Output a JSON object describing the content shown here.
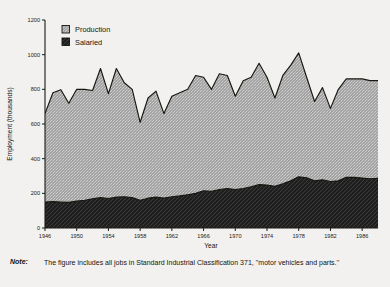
{
  "chart_data": {
    "type": "area",
    "title": "",
    "xlabel": "Year",
    "ylabel": "Employment (thousands)",
    "xlim": [
      1946,
      1988
    ],
    "ylim": [
      0,
      1200
    ],
    "ytick_values": [
      0,
      200,
      400,
      600,
      800,
      1000,
      1200
    ],
    "ytick_labels": [
      "0",
      "200",
      "400",
      "600",
      "800",
      "1000",
      "1200"
    ],
    "xtick_values": [
      1946,
      1950,
      1954,
      1958,
      1962,
      1966,
      1970,
      1974,
      1978,
      1982,
      1986
    ],
    "xtick_labels": [
      "1946",
      "1950",
      "1954",
      "1958",
      "1962",
      "1966",
      "1970",
      "1974",
      "1978",
      "1982",
      "1986"
    ],
    "grid": false,
    "stacked": true,
    "legend_position": "upper-left",
    "x": [
      1946,
      1947,
      1948,
      1949,
      1950,
      1951,
      1952,
      1953,
      1954,
      1955,
      1956,
      1957,
      1958,
      1959,
      1960,
      1961,
      1962,
      1963,
      1964,
      1965,
      1966,
      1967,
      1968,
      1969,
      1970,
      1971,
      1972,
      1973,
      1974,
      1975,
      1976,
      1977,
      1978,
      1979,
      1980,
      1981,
      1982,
      1983,
      1984,
      1985,
      1986,
      1987,
      1988
    ],
    "series": [
      {
        "name": "Salaried",
        "color": "#232323",
        "pattern": "diagonal-hatch-dark",
        "values": [
          150,
          152,
          150,
          148,
          155,
          160,
          168,
          175,
          170,
          178,
          180,
          176,
          160,
          172,
          178,
          172,
          180,
          185,
          192,
          200,
          215,
          212,
          222,
          228,
          222,
          228,
          238,
          250,
          248,
          240,
          255,
          272,
          295,
          290,
          272,
          278,
          268,
          272,
          292,
          292,
          288,
          284,
          286
        ]
      },
      {
        "name": "Production",
        "color": "#9d9d9d",
        "pattern": "stipple-light",
        "values": [
          510,
          628,
          648,
          572,
          645,
          640,
          625,
          745,
          605,
          742,
          658,
          624,
          450,
          578,
          612,
          488,
          580,
          595,
          608,
          680,
          655,
          588,
          668,
          652,
          538,
          622,
          632,
          700,
          622,
          510,
          625,
          668,
          715,
          580,
          458,
          532,
          422,
          528,
          568,
          568,
          572,
          566,
          564
        ]
      }
    ],
    "totals": [
      660,
      780,
      798,
      720,
      800,
      800,
      793,
      920,
      775,
      920,
      838,
      800,
      610,
      750,
      790,
      660,
      760,
      780,
      800,
      880,
      870,
      800,
      890,
      880,
      760,
      850,
      870,
      950,
      870,
      750,
      880,
      940,
      1010,
      870,
      730,
      810,
      690,
      800,
      860,
      860,
      860,
      850,
      850
    ]
  },
  "legend": {
    "items": [
      {
        "label": "Production",
        "swatch": "light-hatch"
      },
      {
        "label": "Salaried",
        "swatch": "dark-hatch"
      }
    ]
  },
  "note": {
    "label": "Note:",
    "text": "The figure includes all jobs in Standard Industrial Classification 371, ''motor vehicles and parts.''"
  }
}
